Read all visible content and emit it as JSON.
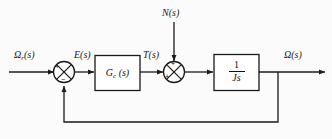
{
  "diagram": {
    "background_color": "#fbfbfb",
    "line_color": "#1a1a1a",
    "signals": {
      "reference": "Ω",
      "reference_subscript": "r",
      "reference_arg": "(s)",
      "error": "E(s)",
      "torque": "T(s)",
      "disturbance": "N(s)",
      "output": "Ω(s)"
    },
    "blocks": [
      {
        "name": "controller",
        "label_main": "G",
        "label_sub": "c",
        "label_arg": " (s)"
      },
      {
        "name": "plant",
        "numerator": "1",
        "denominator": "Js"
      }
    ],
    "summing_junctions": [
      {
        "name": "error-junction",
        "input_sign": "+",
        "feedback_sign": "−"
      },
      {
        "name": "disturbance-junction",
        "input_sign": "+",
        "disturbance_sign": "+"
      }
    ]
  }
}
